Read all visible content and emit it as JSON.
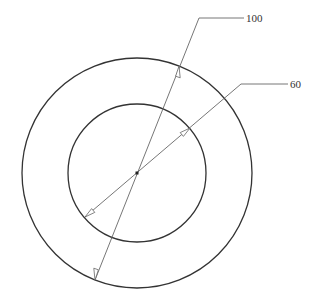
{
  "diagram": {
    "type": "concentric-circles-dimension-drawing",
    "center": {
      "x": 137,
      "y": 173
    },
    "outer_circle": {
      "radius_px": 115,
      "dimension_label": "100"
    },
    "inner_circle": {
      "radius_px": 69,
      "dimension_label": "60"
    },
    "colors": {
      "circle_stroke": "#333333",
      "leader_stroke": "#666666",
      "text": "#333333",
      "background": "#ffffff"
    }
  },
  "labels": {
    "outer_diameter": "100",
    "inner_diameter": "60"
  }
}
